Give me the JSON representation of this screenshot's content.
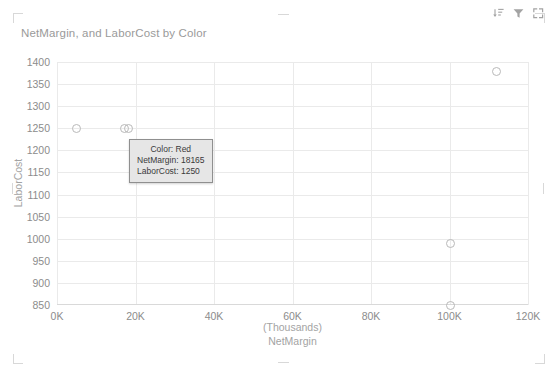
{
  "visual": {
    "title": "NetMargin, and LaborCost by Color",
    "header_icons": [
      {
        "name": "drill-down-icon",
        "label": "Drill down"
      },
      {
        "name": "filter-icon",
        "label": "Filters"
      },
      {
        "name": "focus-mode-icon",
        "label": "Focus mode"
      }
    ]
  },
  "tooltip": {
    "visible": true,
    "rows": [
      {
        "label": "Color:",
        "value": "Red",
        "text": "Color: Red"
      },
      {
        "label": "NetMargin:",
        "value": "18165",
        "text": "NetMargin: 18165"
      },
      {
        "label": "LaborCost:",
        "value": "1250",
        "text": "LaborCost: 1250"
      }
    ]
  },
  "colors": {
    "title": "#9a9a9a",
    "tick": "#8c8c8c",
    "axis_title": "#a3a3a3",
    "gridline": "#eaeaea",
    "marker_stroke": "#b9b9b9",
    "tooltip_bg": "#e6e6e6",
    "tooltip_border": "#8f8f8f",
    "handle": "#d8d8d8",
    "background": "#ffffff"
  },
  "chart_data": {
    "type": "scatter",
    "title": "NetMargin, and LaborCost by Color",
    "xlabel": "NetMargin",
    "xlabel_unit": "(Thousands)",
    "ylabel": "LaborCost",
    "xlim": [
      0,
      120000
    ],
    "ylim": [
      850,
      1400
    ],
    "xticks": [
      0,
      20000,
      40000,
      60000,
      80000,
      100000,
      120000
    ],
    "xtick_labels": [
      "0K",
      "20K",
      "40K",
      "60K",
      "80K",
      "100K",
      "120K"
    ],
    "yticks": [
      850,
      900,
      950,
      1000,
      1050,
      1100,
      1150,
      1200,
      1250,
      1300,
      1350,
      1400
    ],
    "ytick_labels": [
      "850",
      "900",
      "950",
      "1000",
      "1050",
      "1100",
      "1150",
      "1200",
      "1250",
      "1300",
      "1350",
      "1400"
    ],
    "grid": true,
    "legend": "none",
    "marker": {
      "shape": "circle",
      "filled": false,
      "size": 9
    },
    "series": [
      {
        "name": "Color",
        "points": [
          {
            "x": 5000,
            "y": 1250,
            "label": ""
          },
          {
            "x": 17200,
            "y": 1250,
            "label": ""
          },
          {
            "x": 18165,
            "y": 1250,
            "label": "Red"
          },
          {
            "x": 112000,
            "y": 1378,
            "label": ""
          },
          {
            "x": 100200,
            "y": 990,
            "label": ""
          },
          {
            "x": 100200,
            "y": 848,
            "label": ""
          }
        ]
      }
    ]
  }
}
